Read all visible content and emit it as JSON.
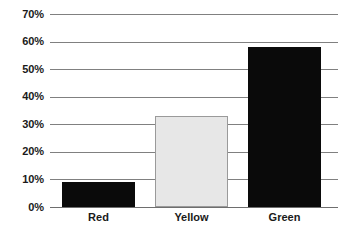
{
  "chart_data": {
    "type": "bar",
    "title": "",
    "subtitle": "",
    "xlabel": "",
    "ylabel": "",
    "categories": [
      "Red",
      "Yellow",
      "Green"
    ],
    "values": [
      9,
      33,
      58
    ],
    "value_labels": [
      "9%",
      "33%",
      "58%"
    ],
    "series": [
      {
        "name": "",
        "values": [
          9,
          33,
          58
        ]
      }
    ],
    "ylim": [
      0,
      70
    ],
    "ytick_labels": [
      "0%",
      "10%",
      "20%",
      "30%",
      "40%",
      "50%",
      "60%",
      "70%"
    ],
    "ytick_values": [
      0,
      10,
      20,
      30,
      40,
      50,
      60,
      70
    ],
    "grid": true,
    "legend": false,
    "legend_position": "none",
    "bar_colors": [
      "#0a0a0a",
      "#e7e7e7",
      "#0a0a0a"
    ],
    "bar_border_colors": [
      "#0a0a0a",
      "#9a9a9a",
      "#0a0a0a"
    ],
    "gridline_color": "#808080",
    "axis_color": "#6e6e6e",
    "text_color": "#1a1a1a",
    "background": "#ffffff"
  },
  "axis": {
    "y_ticks": [
      {
        "label": "70%",
        "value": 70
      },
      {
        "label": "60%",
        "value": 60
      },
      {
        "label": "50%",
        "value": 50
      },
      {
        "label": "40%",
        "value": 40
      },
      {
        "label": "30%",
        "value": 30
      },
      {
        "label": "20%",
        "value": 20
      },
      {
        "label": "10%",
        "value": 10
      },
      {
        "label": "0%",
        "value": 0
      }
    ],
    "x_categories": [
      {
        "label": "Red"
      },
      {
        "label": "Yellow"
      },
      {
        "label": "Green"
      }
    ]
  }
}
